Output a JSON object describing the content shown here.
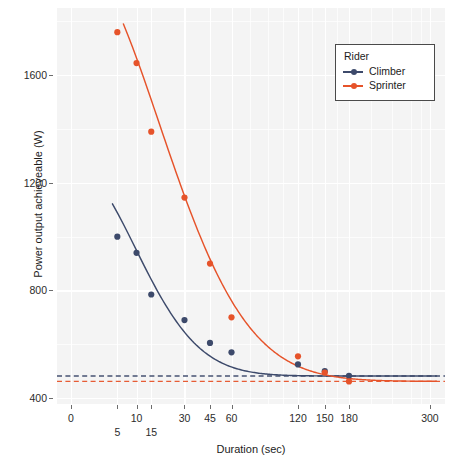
{
  "chart_data": {
    "type": "scatter",
    "title": "",
    "xlabel": "Duration (sec)",
    "ylabel": "Power output achieveable (W)",
    "xticks": [
      0,
      5,
      10,
      15,
      30,
      45,
      60,
      120,
      150,
      180,
      300
    ],
    "xtick_labels": [
      "0",
      "5",
      "10",
      "15",
      "30",
      "45",
      "60",
      "120",
      "150",
      "180",
      "300"
    ],
    "xtick_rows": [
      0,
      1,
      0,
      1,
      0,
      0,
      0,
      0,
      0,
      0,
      0
    ],
    "yticks": [
      400,
      800,
      1200,
      1600
    ],
    "ytick_labels": [
      "400",
      "800",
      "1200",
      "1600"
    ],
    "xlim": [
      -6,
      318
    ],
    "ylim": [
      378,
      1820
    ],
    "grid": true,
    "legend": {
      "title": "Rider",
      "position": "top-right",
      "entries": [
        "Climber",
        "Sprinter"
      ]
    },
    "series": [
      {
        "name": "Climber",
        "color": "#3d4a6b",
        "points": [
          {
            "x": 5,
            "y": 1000
          },
          {
            "x": 10,
            "y": 940
          },
          {
            "x": 15,
            "y": 785
          },
          {
            "x": 30,
            "y": 690
          },
          {
            "x": 45,
            "y": 605
          },
          {
            "x": 60,
            "y": 570
          },
          {
            "x": 120,
            "y": 525
          },
          {
            "x": 150,
            "y": 500
          },
          {
            "x": 180,
            "y": 483
          }
        ],
        "fit_curve": {
          "asymptote": 482,
          "amplitude": 640,
          "tau": 19
        },
        "asymptote": 482
      },
      {
        "name": "Sprinter",
        "color": "#e6532a",
        "points": [
          {
            "x": 5,
            "y": 1760
          },
          {
            "x": 10,
            "y": 1645
          },
          {
            "x": 15,
            "y": 1390
          },
          {
            "x": 30,
            "y": 1145
          },
          {
            "x": 45,
            "y": 900
          },
          {
            "x": 60,
            "y": 700
          },
          {
            "x": 120,
            "y": 555
          },
          {
            "x": 150,
            "y": 495
          },
          {
            "x": 180,
            "y": 462
          }
        ],
        "fit_curve": {
          "asymptote": 462,
          "amplitude": 1420,
          "tau": 36
        },
        "asymptote": 462
      }
    ],
    "asymptote_lines": [
      {
        "series": "Climber",
        "value": 482,
        "color": "#3d4a6b",
        "style": "dashed"
      },
      {
        "series": "Sprinter",
        "value": 462,
        "color": "#e6532a",
        "style": "dashed"
      }
    ],
    "colors": {
      "panel_background": "#f4f4f4",
      "grid": "#ffffff",
      "climber": "#3d4a6b",
      "sprinter": "#e6532a",
      "text": "#1c1c1c"
    }
  }
}
